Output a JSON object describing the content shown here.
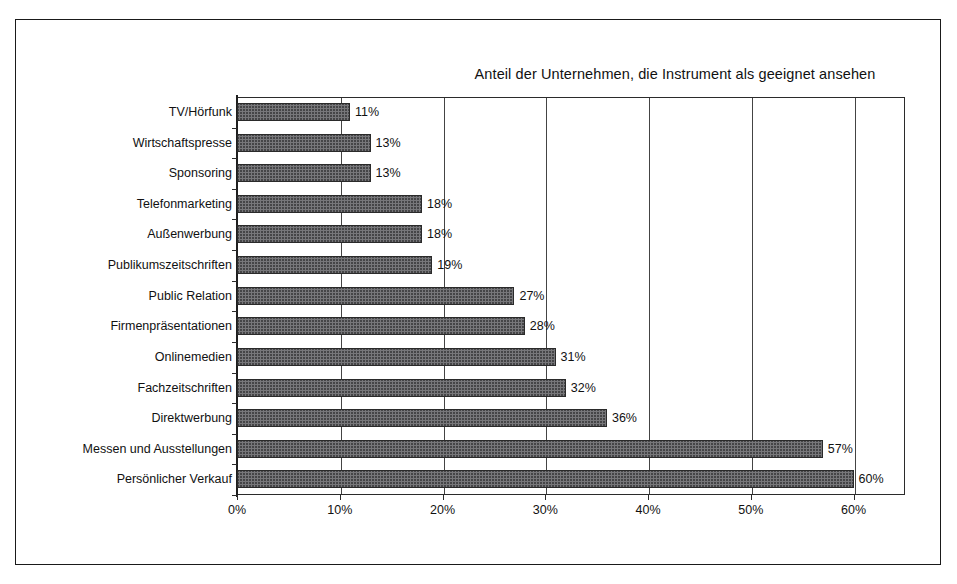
{
  "chart_data": {
    "type": "bar",
    "orientation": "horizontal",
    "title": "Anteil der Unternehmen, die Instrument als geeignet ansehen",
    "xlabel": "",
    "ylabel": "",
    "xlim": [
      0,
      65
    ],
    "grid": true,
    "legend": null,
    "categories": [
      "TV/Hörfunk",
      "Wirtschaftspresse",
      "Sponsoring",
      "Telefonmarketing",
      "Außenwerbung",
      "Publikumszeitschriften",
      "Public Relation",
      "Firmenpräsentationen",
      "Onlinemedien",
      "Fachzeitschriften",
      "Direktwerbung",
      "Messen und Ausstellungen",
      "Persönlicher Verkauf"
    ],
    "values": [
      11,
      13,
      13,
      18,
      18,
      19,
      27,
      28,
      31,
      32,
      36,
      57,
      60
    ],
    "data_labels": [
      "11%",
      "13%",
      "13%",
      "18%",
      "18%",
      "19%",
      "27%",
      "28%",
      "31%",
      "32%",
      "36%",
      "57%",
      "60%"
    ],
    "x_ticks": [
      0,
      10,
      20,
      30,
      40,
      50,
      60
    ],
    "x_tick_labels": [
      "0%",
      "10%",
      "20%",
      "30%",
      "40%",
      "50%",
      "60%"
    ],
    "colors": {
      "bar_fill": "#77777a",
      "bar_border": "#2a2a2a",
      "gridline": "#444444",
      "axis": "#1f1f1f",
      "frame": "#1a1a1a",
      "text": "#111111",
      "background": "#ffffff"
    }
  }
}
